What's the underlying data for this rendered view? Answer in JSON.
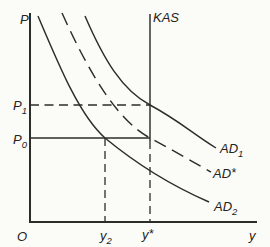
{
  "figure": {
    "type": "as-ad-economics-diagram",
    "colors": {
      "background": "#fbfbf8",
      "ink": "#2c2c28"
    },
    "axes": {
      "y_axis_label": "P",
      "x_axis_label": "y",
      "origin_label": "O"
    },
    "supply_line": {
      "label": "KAS",
      "style": "vertical, solid above P0, dashed below P0 down to x-axis"
    },
    "demand_curves": [
      {
        "name": "AD1",
        "base": "AD",
        "sub": "1",
        "style": "solid",
        "position": "rightmost, crosses KAS at P1"
      },
      {
        "name": "AD*",
        "base": "AD",
        "sup": "*",
        "style": "dashed",
        "position": "middle, crosses KAS at P0"
      },
      {
        "name": "AD2",
        "base": "AD",
        "sub": "2",
        "style": "solid",
        "position": "leftmost, crosses P0 at y2"
      }
    ],
    "price_levels": [
      {
        "name": "P1",
        "base": "P",
        "sub": "1",
        "line_style": "dashed horizontal to KAS"
      },
      {
        "name": "P0",
        "base": "P",
        "sub": "0",
        "line_style": "solid horizontal to KAS"
      }
    ],
    "output_levels": [
      {
        "name": "y2",
        "base": "y",
        "sub": "2",
        "line_style": "dashed vertical from P0 line to x-axis"
      },
      {
        "name": "y*",
        "base": "y",
        "sup": "*",
        "line_style": "dashed vertical below KAS"
      }
    ]
  }
}
